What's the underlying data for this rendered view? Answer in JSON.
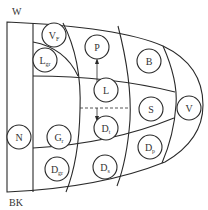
{
  "edge_labels": {
    "top_left": "W",
    "bottom_left": "BK"
  },
  "regions": [
    {
      "id": "N",
      "main": "N",
      "sub": ""
    },
    {
      "id": "VF",
      "main": "V",
      "sub": "F"
    },
    {
      "id": "Lgr",
      "main": "L",
      "sub": "gr"
    },
    {
      "id": "Gr",
      "main": "G",
      "sub": "r"
    },
    {
      "id": "Dgr",
      "main": "D",
      "sub": "gr"
    },
    {
      "id": "P",
      "main": "P",
      "sub": ""
    },
    {
      "id": "L",
      "main": "L",
      "sub": ""
    },
    {
      "id": "Dt",
      "main": "D",
      "sub": "t"
    },
    {
      "id": "Ds",
      "main": "D",
      "sub": "s"
    },
    {
      "id": "B",
      "main": "B",
      "sub": ""
    },
    {
      "id": "S",
      "main": "S",
      "sub": ""
    },
    {
      "id": "Dp",
      "main": "D",
      "sub": "p"
    },
    {
      "id": "V",
      "main": "V",
      "sub": ""
    }
  ],
  "arrows": [
    {
      "from": "L",
      "to": "P",
      "label": ""
    },
    {
      "from": "Gr",
      "to": "Dt",
      "style": "dashed",
      "label": ""
    }
  ]
}
